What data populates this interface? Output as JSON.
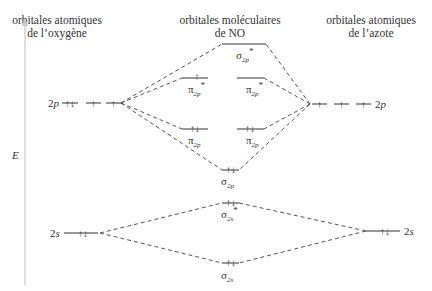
{
  "headers": {
    "left": [
      "orbitales atomiques",
      "de l’oxygène"
    ],
    "center": [
      "orbitales moléculaires",
      "de NO"
    ],
    "right": [
      "orbitales atomiques",
      "de l’azote"
    ]
  },
  "axis": {
    "label": "E"
  },
  "atomic_orbitals": {
    "oxygen": {
      "2p": {
        "label": "2p",
        "electrons": [
          "↑↓",
          "↑",
          "↑"
        ]
      },
      "2s": {
        "label": "2s",
        "electrons": [
          "↑↓"
        ]
      }
    },
    "nitrogen": {
      "2p": {
        "label": "2p",
        "electrons": [
          "↑",
          "↑",
          "↑"
        ]
      },
      "2s": {
        "label": "2s",
        "electrons": [
          "↑↓"
        ]
      }
    }
  },
  "molecular_orbitals": [
    {
      "name": "sigma2p_star",
      "symbol": "σ",
      "sub": "2p",
      "star": "*",
      "electrons": ""
    },
    {
      "name": "pi2p_star_a",
      "symbol": "π",
      "sub": "2p",
      "star": "*",
      "electrons": "↑"
    },
    {
      "name": "pi2p_star_b",
      "symbol": "π",
      "sub": "2p",
      "star": "*",
      "electrons": ""
    },
    {
      "name": "pi2p_a",
      "symbol": "π",
      "sub": "2p",
      "star": "",
      "electrons": "↑↓"
    },
    {
      "name": "pi2p_b",
      "symbol": "π",
      "sub": "2p",
      "star": "",
      "electrons": "↑↓"
    },
    {
      "name": "sigma2p",
      "symbol": "σ",
      "sub": "2p",
      "star": "",
      "electrons": "↑↓"
    },
    {
      "name": "sigma2s_star",
      "symbol": "σ",
      "sub": "2s",
      "star": "*",
      "electrons": "↑↓"
    },
    {
      "name": "sigma2s",
      "symbol": "σ",
      "sub": "2s",
      "star": "",
      "electrons": "↑↓"
    }
  ]
}
